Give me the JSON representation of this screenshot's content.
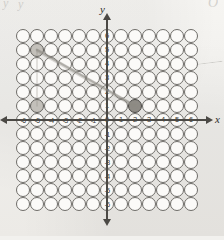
{
  "figure": {
    "kind": "coordinate-grid-bubble-sheet",
    "background_color": "#f1f0ed",
    "ink_color": "#4b4945",
    "pencil_color": "#8d8a84"
  },
  "axes": {
    "x_name": "x",
    "y_name": "y",
    "x_labels": [
      "-6",
      "-5",
      "-4",
      "-3",
      "-2",
      "-1",
      "0",
      "1",
      "2",
      "3",
      "4",
      "5",
      "6"
    ],
    "y_labels": [
      "6",
      "5",
      "4",
      "3",
      "2",
      "1",
      "-1",
      "-2",
      "-3",
      "-4",
      "-5",
      "-6"
    ],
    "origin_label": "0",
    "x_min": -6,
    "x_max": 6,
    "y_min": -6,
    "y_max": 6,
    "arrows": {
      "right": "arrow-right",
      "left": "arrow-left",
      "up": "arrow-up",
      "down": "arrow-down"
    }
  },
  "grid": {
    "columns": 13,
    "rows": 13,
    "cell_size_px": 14,
    "bubble_shape": "circle"
  },
  "chart_data": {
    "type": "scatter",
    "title": "",
    "xlabel": "x",
    "ylabel": "y",
    "xlim": [
      -6,
      6
    ],
    "ylim": [
      -6,
      6
    ],
    "grid": true,
    "legend": "none",
    "xticks": [
      -6,
      -5,
      -4,
      -3,
      -2,
      -1,
      0,
      1,
      2,
      3,
      4,
      5,
      6
    ],
    "yticks": [
      -6,
      -5,
      -4,
      -3,
      -2,
      -1,
      1,
      2,
      3,
      4,
      5,
      6
    ],
    "annotations": [
      {
        "name": "pencil-segment",
        "type": "line-segment",
        "from": [
          -5,
          5
        ],
        "to": [
          2,
          1
        ],
        "style": "pencil"
      },
      {
        "name": "marked-point",
        "type": "filled-bubble",
        "point": [
          2,
          1
        ]
      },
      {
        "name": "smudge-upper-left",
        "type": "filled-bubble",
        "point": [
          -5,
          5
        ]
      },
      {
        "name": "smudge-lower-left",
        "type": "filled-bubble",
        "point": [
          -5,
          1
        ]
      }
    ],
    "series": [
      {
        "name": "pencil line",
        "x": [
          -5,
          2
        ],
        "y": [
          5,
          1
        ]
      }
    ]
  },
  "ghost_marks": {
    "top_left": "y",
    "top_left_2": "y",
    "top_right": "O"
  }
}
